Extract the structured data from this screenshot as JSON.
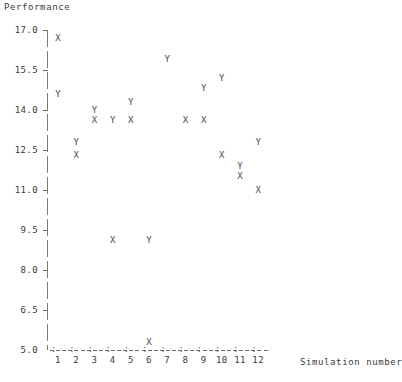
{
  "chart_data": {
    "type": "scatter",
    "title": "",
    "xlabel": "Simulation number",
    "ylabel": "Performance",
    "xlim": [
      0.5,
      12.5
    ],
    "ylim": [
      5.0,
      17.0
    ],
    "grid": false,
    "legend_position": "none",
    "x_tick_labels": [
      "1",
      "2",
      "3",
      "4",
      "5",
      "6",
      "7",
      "8",
      "9",
      "10",
      "11",
      "12"
    ],
    "x_tick_values": [
      1,
      2,
      3,
      4,
      5,
      6,
      7,
      8,
      9,
      10,
      11,
      12
    ],
    "y_tick_labels": [
      "17.0",
      "15.5",
      "14.0",
      "12.5",
      "11.0",
      "9.5",
      "8.0",
      "6.5",
      "5.0"
    ],
    "y_tick_values": [
      17.0,
      15.5,
      14.0,
      12.5,
      11.0,
      9.5,
      8.0,
      6.5,
      5.0
    ],
    "marker_glyphs": {
      "X": "X",
      "Y": "Y"
    },
    "series": [
      {
        "name": "X",
        "marker": "X",
        "points": [
          {
            "x": 1,
            "y": 16.7
          },
          {
            "x": 2,
            "y": 12.3
          },
          {
            "x": 3,
            "y": 13.6
          },
          {
            "x": 4,
            "y": 9.1
          },
          {
            "x": 5,
            "y": 13.6
          },
          {
            "x": 6,
            "y": 5.3
          },
          {
            "x": 8,
            "y": 13.6
          },
          {
            "x": 9,
            "y": 13.6
          },
          {
            "x": 10,
            "y": 12.3
          },
          {
            "x": 11,
            "y": 11.5
          },
          {
            "x": 12,
            "y": 11.0
          }
        ]
      },
      {
        "name": "Y",
        "marker": "Y",
        "points": [
          {
            "x": 1,
            "y": 14.6
          },
          {
            "x": 2,
            "y": 12.8
          },
          {
            "x": 3,
            "y": 14.0
          },
          {
            "x": 4,
            "y": 13.6
          },
          {
            "x": 5,
            "y": 14.3
          },
          {
            "x": 6,
            "y": 9.1
          },
          {
            "x": 7,
            "y": 15.9
          },
          {
            "x": 9,
            "y": 14.8
          },
          {
            "x": 10,
            "y": 15.2
          },
          {
            "x": 11,
            "y": 11.9
          },
          {
            "x": 12,
            "y": 12.8
          }
        ]
      }
    ]
  },
  "axes": {
    "y_title": "Performance",
    "x_title": "Simulation number"
  },
  "footer": {
    "smudge": ""
  }
}
